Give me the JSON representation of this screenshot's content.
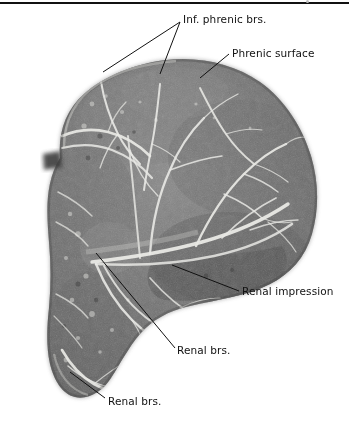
{
  "figure": {
    "kind": "anatomical-radiograph",
    "modality": "radiograph with arterial contrast injection",
    "orientation": "anterior view",
    "background_color": "#ffffff",
    "parenchyma_color": "#6b6b6b",
    "vessel_color": "#e8e8e4",
    "rule_color": "#111111",
    "label_color": "#111111",
    "leader_color": "#111111"
  },
  "rule": {
    "present": true,
    "position": "top",
    "thickness_px": 2
  },
  "labels": [
    {
      "id": "inf-phrenic-brs",
      "text": "Inf. phrenic brs.",
      "anchor_x": 183,
      "anchor_y": 14,
      "leaders": [
        {
          "x1": 180,
          "y1": 22,
          "x2": 103,
          "y2": 72
        },
        {
          "x1": 180,
          "y1": 22,
          "x2": 160,
          "y2": 74
        }
      ]
    },
    {
      "id": "phrenic-surface",
      "text": "Phrenic surface",
      "anchor_x": 232,
      "anchor_y": 48,
      "leaders": [
        {
          "x1": 229,
          "y1": 54,
          "x2": 200,
          "y2": 78
        }
      ]
    },
    {
      "id": "renal-impression",
      "text": "Renal impression",
      "anchor_x": 242,
      "anchor_y": 286,
      "leaders": [
        {
          "x1": 239,
          "y1": 291,
          "x2": 172,
          "y2": 265
        }
      ]
    },
    {
      "id": "renal-brs-mid",
      "text": "Renal brs.",
      "anchor_x": 177,
      "anchor_y": 345,
      "leaders": [
        {
          "x1": 175,
          "y1": 348,
          "x2": 96,
          "y2": 253
        }
      ]
    },
    {
      "id": "renal-brs-low",
      "text": "Renal brs.",
      "anchor_x": 108,
      "anchor_y": 396,
      "leaders": [
        {
          "x1": 105,
          "y1": 398,
          "x2": 70,
          "y2": 372
        }
      ]
    }
  ],
  "specimen": {
    "outline_path": "M 58 168 C 56 140 62 112 80 92 C 100 70 128 58 160 55 C 196 52 232 60 258 78 C 282 95 300 122 310 152 C 318 176 318 202 312 224 C 306 246 294 262 276 272 C 252 284 222 290 192 296 C 168 300 150 308 138 322 C 126 336 118 352 110 366 C 102 380 90 388 78 386 C 66 384 58 372 54 356 C 50 340 50 322 52 304 C 54 282 54 258 52 236 C 50 214 46 192 58 168 Z",
    "notch_path": "M 44 148 L 58 146 L 60 160 L 44 162 Z",
    "left_lobe_path": "M 44 150 C 42 176 44 210 46 244 C 48 276 48 306 50 334 C 52 356 58 376 74 384 C 86 390 98 382 106 370",
    "hilum": {
      "x": 100,
      "y": 250
    },
    "bounds": {
      "left": 42,
      "top": 50,
      "right": 318,
      "bottom": 392
    }
  },
  "vessels": {
    "description": "white contrast-filled arterial branches radiating from the hilum toward the phrenic surface and inferiorly toward the renal branches",
    "main_trunk": "M 96 252 C 130 248 168 244 204 236 C 236 228 266 216 288 200",
    "branch_count": 22
  }
}
